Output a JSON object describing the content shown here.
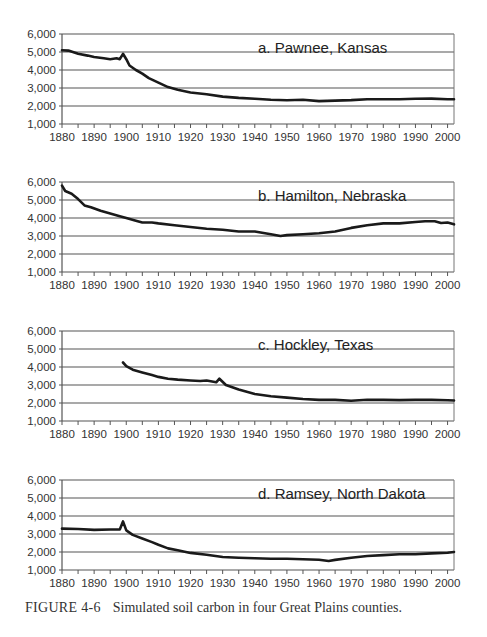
{
  "figure": {
    "label": "FIGURE 4-6",
    "caption": "Simulated soil carbon in four Great Plains counties."
  },
  "chart_data": [
    {
      "type": "line",
      "title": "a. Pawnee, Kansas",
      "xlabel": "",
      "ylabel": "",
      "xlim": [
        1880,
        2002
      ],
      "ylim": [
        1000,
        6000
      ],
      "xticks": [
        1880,
        1890,
        1900,
        1910,
        1920,
        1930,
        1940,
        1950,
        1960,
        1970,
        1980,
        1990,
        2000
      ],
      "yticks": [
        1000,
        2000,
        3000,
        4000,
        5000,
        6000
      ],
      "ytick_labels": [
        "1,000",
        "2,000",
        "3,000",
        "4,000",
        "5,000",
        "6,000"
      ],
      "grid": true,
      "series": [
        {
          "name": "Soil carbon",
          "x": [
            1880,
            1882,
            1885,
            1888,
            1890,
            1893,
            1895,
            1897,
            1898,
            1899,
            1900,
            1901,
            1903,
            1905,
            1907,
            1910,
            1913,
            1916,
            1920,
            1925,
            1930,
            1935,
            1940,
            1945,
            1950,
            1955,
            1960,
            1965,
            1970,
            1975,
            1980,
            1985,
            1990,
            1995,
            2000,
            2002
          ],
          "y": [
            5100,
            5080,
            4900,
            4800,
            4720,
            4650,
            4600,
            4650,
            4600,
            4900,
            4600,
            4250,
            4000,
            3800,
            3550,
            3300,
            3050,
            2900,
            2750,
            2650,
            2520,
            2450,
            2400,
            2350,
            2320,
            2350,
            2270,
            2300,
            2330,
            2380,
            2370,
            2380,
            2400,
            2410,
            2380,
            2380
          ]
        }
      ]
    },
    {
      "type": "line",
      "title": "b. Hamilton, Nebraska",
      "xlabel": "",
      "ylabel": "",
      "xlim": [
        1880,
        2002
      ],
      "ylim": [
        1000,
        6000
      ],
      "xticks": [
        1880,
        1890,
        1900,
        1910,
        1920,
        1930,
        1940,
        1950,
        1960,
        1970,
        1980,
        1990,
        2000
      ],
      "yticks": [
        1000,
        2000,
        3000,
        4000,
        5000,
        6000
      ],
      "ytick_labels": [
        "1,000",
        "2,000",
        "3,000",
        "4,000",
        "5,000",
        "6,000"
      ],
      "grid": true,
      "series": [
        {
          "name": "Soil carbon",
          "x": [
            1880,
            1881,
            1883,
            1885,
            1887,
            1889,
            1892,
            1895,
            1898,
            1900,
            1903,
            1905,
            1908,
            1910,
            1915,
            1920,
            1925,
            1930,
            1935,
            1940,
            1945,
            1948,
            1950,
            1955,
            1960,
            1965,
            1970,
            1975,
            1980,
            1985,
            1990,
            1993,
            1996,
            1998,
            2000,
            2002
          ],
          "y": [
            5800,
            5500,
            5350,
            5050,
            4700,
            4600,
            4400,
            4250,
            4100,
            4000,
            3850,
            3750,
            3750,
            3700,
            3600,
            3500,
            3400,
            3350,
            3250,
            3250,
            3100,
            3000,
            3050,
            3100,
            3150,
            3250,
            3450,
            3600,
            3700,
            3700,
            3780,
            3820,
            3820,
            3720,
            3750,
            3650
          ]
        }
      ]
    },
    {
      "type": "line",
      "title": "c. Hockley, Texas",
      "xlabel": "",
      "ylabel": "",
      "xlim": [
        1880,
        2002
      ],
      "ylim": [
        1000,
        6000
      ],
      "xticks": [
        1880,
        1890,
        1900,
        1910,
        1920,
        1930,
        1940,
        1950,
        1960,
        1970,
        1980,
        1990,
        2000
      ],
      "yticks": [
        1000,
        2000,
        3000,
        4000,
        5000,
        6000
      ],
      "ytick_labels": [
        "1,000",
        "2,000",
        "3,000",
        "4,000",
        "5,000",
        "6,000"
      ],
      "grid": true,
      "series": [
        {
          "name": "Soil carbon",
          "x": [
            1899,
            1900,
            1902,
            1905,
            1908,
            1910,
            1913,
            1916,
            1920,
            1923,
            1925,
            1928,
            1929,
            1931,
            1935,
            1940,
            1945,
            1950,
            1955,
            1960,
            1965,
            1970,
            1975,
            1980,
            1985,
            1990,
            1995,
            2000,
            2002
          ],
          "y": [
            4250,
            4050,
            3850,
            3700,
            3550,
            3450,
            3350,
            3300,
            3250,
            3220,
            3250,
            3150,
            3350,
            3000,
            2750,
            2500,
            2380,
            2300,
            2220,
            2170,
            2170,
            2120,
            2180,
            2170,
            2160,
            2170,
            2170,
            2150,
            2140
          ]
        }
      ]
    },
    {
      "type": "line",
      "title": "d. Ramsey, North Dakota",
      "xlabel": "",
      "ylabel": "",
      "xlim": [
        1880,
        2002
      ],
      "ylim": [
        1000,
        6000
      ],
      "xticks": [
        1880,
        1890,
        1900,
        1910,
        1920,
        1930,
        1940,
        1950,
        1960,
        1970,
        1980,
        1990,
        2000
      ],
      "yticks": [
        1000,
        2000,
        3000,
        4000,
        5000,
        6000
      ],
      "ytick_labels": [
        "1,000",
        "2,000",
        "3,000",
        "4,000",
        "5,000",
        "6,000"
      ],
      "grid": true,
      "series": [
        {
          "name": "Soil carbon",
          "x": [
            1880,
            1885,
            1890,
            1895,
            1898,
            1899,
            1900,
            1902,
            1905,
            1908,
            1910,
            1913,
            1916,
            1920,
            1925,
            1930,
            1935,
            1940,
            1945,
            1950,
            1955,
            1960,
            1963,
            1965,
            1970,
            1975,
            1980,
            1985,
            1990,
            1995,
            2000,
            2002
          ],
          "y": [
            3300,
            3280,
            3230,
            3250,
            3250,
            3700,
            3200,
            2950,
            2750,
            2550,
            2400,
            2200,
            2100,
            1950,
            1850,
            1720,
            1680,
            1650,
            1620,
            1620,
            1600,
            1570,
            1500,
            1560,
            1680,
            1780,
            1830,
            1880,
            1880,
            1920,
            1960,
            2000
          ]
        }
      ]
    }
  ]
}
